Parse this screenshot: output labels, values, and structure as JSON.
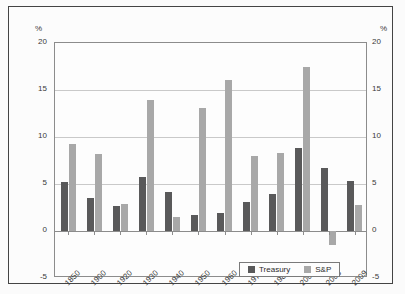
{
  "chart_data": {
    "type": "bar",
    "title": "",
    "subtitle": "",
    "xlabel": "",
    "ylabel": "%",
    "ylabel_right": "%",
    "ylim": [
      -5,
      20
    ],
    "yticks": [
      20,
      15,
      10,
      5,
      0,
      -5
    ],
    "grid": true,
    "legend_position": "bottom-right",
    "categories": [
      "1850",
      "1900",
      "1920",
      "1930",
      "1940",
      "1950",
      "1960",
      "1970",
      "1980",
      "2000",
      "2008",
      "2009"
    ],
    "series": [
      {
        "name": "Treasury",
        "color": "#59595a",
        "values": [
          5.2,
          3.5,
          2.7,
          5.7,
          4.1,
          1.7,
          1.9,
          3.1,
          3.9,
          8.8,
          6.7,
          5.3
        ]
      },
      {
        "name": "S&P",
        "color": "#a8a8a8",
        "values": [
          9.3,
          8.2,
          2.9,
          13.9,
          1.5,
          13.1,
          16.1,
          8.0,
          8.3,
          17.5,
          -1.5,
          2.8
        ]
      }
    ]
  },
  "axes": {
    "unit_left": "%",
    "unit_right": "%",
    "ytick_labels": [
      "20",
      "15",
      "10",
      "5",
      "0",
      "-5"
    ],
    "xtick_labels": [
      "1850",
      "1900",
      "1920",
      "1930",
      "1940",
      "1950",
      "1960",
      "1970",
      "1980",
      "2000",
      "2008",
      "2009"
    ]
  },
  "legend": {
    "entries": [
      {
        "label": "Treasury",
        "color": "#59595a"
      },
      {
        "label": "S&P",
        "color": "#a8a8a8"
      }
    ]
  }
}
